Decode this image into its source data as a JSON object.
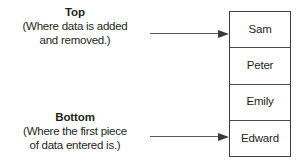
{
  "diagram": {
    "type": "stack-data-structure",
    "annotations": [
      {
        "id": "top",
        "title": "Top",
        "description_lines": [
          "(Where data is added",
          "and removed.)"
        ],
        "points_to": "Sam"
      },
      {
        "id": "bottom",
        "title": "Bottom",
        "description_lines": [
          "(Where the first piece",
          "of data entered is.)"
        ],
        "points_to": "Edward"
      }
    ],
    "stack": {
      "cells": [
        {
          "label": "Sam"
        },
        {
          "label": "Peter"
        },
        {
          "label": "Emily"
        },
        {
          "label": "Edward"
        }
      ]
    },
    "colors": {
      "text": "#231f20",
      "border": "#3f3f41",
      "arrow": "#58595b",
      "background": "#ffffff"
    }
  }
}
